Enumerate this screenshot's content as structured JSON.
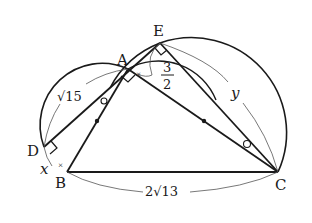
{
  "diagram": {
    "type": "geometry",
    "points": {
      "A": {
        "label": "A",
        "x": 128,
        "y": 69
      },
      "B": {
        "label": "B",
        "x": 67,
        "y": 172
      },
      "C": {
        "label": "C",
        "x": 278,
        "y": 172
      },
      "D": {
        "label": "D",
        "x": 44,
        "y": 147
      },
      "E": {
        "label": "E",
        "x": 160,
        "y": 43
      }
    },
    "measures": {
      "AD": "√15",
      "BC": "2√13",
      "AE_num": "3",
      "AE_den": "2",
      "BD": "x",
      "EC": "y"
    },
    "colors": {
      "line": "#1a1a1a",
      "thin": "#555555"
    }
  }
}
